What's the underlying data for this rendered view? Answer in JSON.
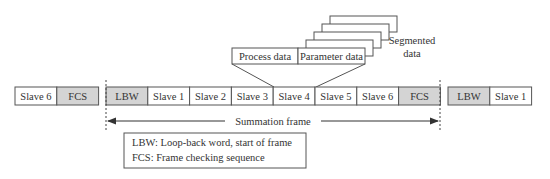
{
  "colors": {
    "gray_fill": "#d4d4d4",
    "white_fill": "#ffffff",
    "stroke": "#555555",
    "text": "#333333"
  },
  "previous_frame_tail": [
    {
      "label": "Slave 6",
      "shaded": false
    },
    {
      "label": "FCS",
      "shaded": true
    }
  ],
  "summation_frame": [
    {
      "label": "LBW",
      "shaded": true
    },
    {
      "label": "Slave 1",
      "shaded": false
    },
    {
      "label": "Slave 2",
      "shaded": false
    },
    {
      "label": "Slave 3",
      "shaded": false
    },
    {
      "label": "Slave 4",
      "shaded": false
    },
    {
      "label": "Slave 5",
      "shaded": false
    },
    {
      "label": "Slave 6",
      "shaded": false
    },
    {
      "label": "FCS",
      "shaded": true
    }
  ],
  "next_frame_head": [
    {
      "label": "LBW",
      "shaded": true
    },
    {
      "label": "Slave 1",
      "shaded": false
    }
  ],
  "expanded_slave": {
    "slave": "Slave 4",
    "fields": [
      "Process data",
      "Parameter data"
    ],
    "segment_stack_count": 4,
    "segment_label_line1": "Segmented",
    "segment_label_line2": "data"
  },
  "summation_label": "Summation frame",
  "legend": {
    "line1": "LBW: Loop-back word, start of frame",
    "line2": "FCS: Frame checking sequence"
  }
}
